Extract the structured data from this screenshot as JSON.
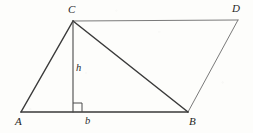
{
  "figure": {
    "kind": "geometry-diagram",
    "background_color": "#fdfdfb",
    "width": 253,
    "height": 133
  },
  "style": {
    "primary_stroke_color": "#3a3a3a",
    "secondary_stroke_color": "#7a7a7a",
    "label_color": "#262626",
    "primary_stroke_width": 1.5,
    "secondary_stroke_width": 1.0,
    "thin_stroke_width": 0.9
  },
  "points": {
    "A": {
      "label": "A",
      "x": 21,
      "y": 112,
      "label_x": 15,
      "label_y": 116
    },
    "B": {
      "label": "B",
      "x": 188,
      "y": 112,
      "label_x": 189,
      "label_y": 116
    },
    "C": {
      "label": "C",
      "x": 73,
      "y": 21,
      "label_x": 68,
      "label_y": 4
    },
    "D": {
      "label": "D",
      "x": 238,
      "y": 20,
      "label_x": 232,
      "label_y": 3
    },
    "F": {
      "label": "",
      "x": 73,
      "y": 112,
      "label_x": 0,
      "label_y": 0
    }
  },
  "segments": [
    {
      "name": "side-AC",
      "from": "A",
      "to": "C",
      "weight": "primary"
    },
    {
      "name": "side-AB",
      "from": "A",
      "to": "B",
      "weight": "primary"
    },
    {
      "name": "diagonal-CB",
      "from": "C",
      "to": "B",
      "weight": "primary"
    },
    {
      "name": "side-CD",
      "from": "C",
      "to": "D",
      "weight": "secondary"
    },
    {
      "name": "side-BD",
      "from": "B",
      "to": "D",
      "weight": "secondary"
    },
    {
      "name": "altitude-CF",
      "from": "C",
      "to": "F",
      "weight": "thin"
    }
  ],
  "measure_labels": {
    "height": {
      "text": "h",
      "x": 76,
      "y": 63
    },
    "base": {
      "text": "b",
      "x": 85,
      "y": 116
    }
  },
  "right_angle_marker": {
    "name": "right-angle-at-foot",
    "x": 73,
    "y": 103,
    "size": 9
  }
}
